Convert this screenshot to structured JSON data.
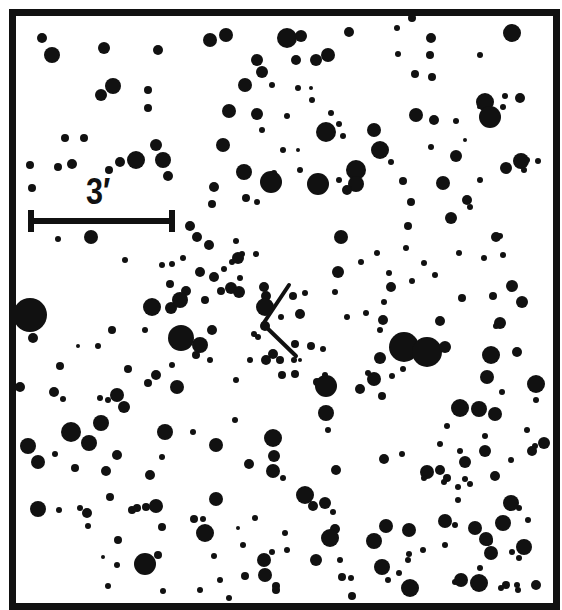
{
  "chart": {
    "title": "",
    "type": "finder-chart",
    "background": "#ffffff",
    "ink": "#111111",
    "scale_bar": {
      "label": "3′",
      "x1": 31,
      "x2": 172,
      "y": 221,
      "tick_height": 22,
      "thickness": 6
    },
    "target_marker": {
      "vertex": [
        263,
        324
      ],
      "upper_end": [
        289,
        285
      ],
      "lower_end": [
        296,
        356
      ],
      "width": 4
    },
    "frame": {
      "x": 9,
      "y": 9,
      "width": 544,
      "height": 594,
      "border": 7
    }
  },
  "stars": [
    [
      42,
      38,
      5
    ],
    [
      52,
      55,
      8
    ],
    [
      104,
      48,
      6
    ],
    [
      158,
      50,
      5
    ],
    [
      113,
      86,
      8
    ],
    [
      101,
      95,
      6
    ],
    [
      148,
      90,
      4
    ],
    [
      148,
      108,
      4
    ],
    [
      65,
      138,
      4
    ],
    [
      84,
      138,
      4
    ],
    [
      156,
      145,
      6
    ],
    [
      163,
      160,
      8
    ],
    [
      136,
      160,
      9
    ],
    [
      120,
      162,
      5
    ],
    [
      109,
      170,
      4
    ],
    [
      72,
      164,
      5
    ],
    [
      58,
      167,
      4
    ],
    [
      30,
      165,
      4
    ],
    [
      32,
      188,
      4
    ],
    [
      168,
      176,
      5
    ],
    [
      91,
      237,
      7
    ],
    [
      58,
      239,
      3
    ],
    [
      125,
      260,
      3
    ],
    [
      172,
      264,
      3
    ],
    [
      210,
      40,
      7
    ],
    [
      226,
      35,
      7
    ],
    [
      287,
      38,
      10
    ],
    [
      301,
      36,
      6
    ],
    [
      349,
      32,
      5
    ],
    [
      257,
      60,
      6
    ],
    [
      262,
      72,
      6
    ],
    [
      296,
      60,
      5
    ],
    [
      316,
      60,
      6
    ],
    [
      328,
      55,
      7
    ],
    [
      245,
      85,
      7
    ],
    [
      272,
      85,
      3
    ],
    [
      298,
      88,
      3
    ],
    [
      311,
      88,
      2
    ],
    [
      312,
      100,
      3
    ],
    [
      229,
      111,
      7
    ],
    [
      257,
      114,
      6
    ],
    [
      223,
      145,
      7
    ],
    [
      262,
      130,
      3
    ],
    [
      287,
      116,
      3
    ],
    [
      331,
      113,
      3
    ],
    [
      326,
      132,
      10
    ],
    [
      339,
      124,
      3
    ],
    [
      343,
      136,
      3
    ],
    [
      298,
      150,
      2
    ],
    [
      283,
      150,
      3
    ],
    [
      274,
      173,
      3
    ],
    [
      244,
      172,
      8
    ],
    [
      271,
      182,
      11
    ],
    [
      318,
      184,
      11
    ],
    [
      356,
      170,
      10
    ],
    [
      356,
      184,
      8
    ],
    [
      347,
      190,
      5
    ],
    [
      339,
      180,
      3
    ],
    [
      214,
      187,
      5
    ],
    [
      212,
      204,
      4
    ],
    [
      246,
      198,
      4
    ],
    [
      257,
      202,
      3
    ],
    [
      256,
      254,
      3
    ],
    [
      300,
      170,
      3
    ],
    [
      412,
      18,
      4
    ],
    [
      397,
      28,
      3
    ],
    [
      431,
      38,
      5
    ],
    [
      430,
      55,
      4
    ],
    [
      480,
      55,
      3
    ],
    [
      512,
      33,
      9
    ],
    [
      398,
      54,
      3
    ],
    [
      415,
      74,
      4
    ],
    [
      432,
      77,
      4
    ],
    [
      416,
      115,
      7
    ],
    [
      434,
      120,
      5
    ],
    [
      484,
      105,
      3
    ],
    [
      479,
      107,
      2
    ],
    [
      505,
      96,
      3
    ],
    [
      485,
      102,
      9
    ],
    [
      490,
      117,
      11
    ],
    [
      503,
      107,
      3
    ],
    [
      520,
      98,
      5
    ],
    [
      456,
      121,
      3
    ],
    [
      456,
      156,
      6
    ],
    [
      374,
      130,
      7
    ],
    [
      380,
      150,
      9
    ],
    [
      431,
      147,
      3
    ],
    [
      391,
      162,
      3
    ],
    [
      465,
      140,
      2
    ],
    [
      443,
      183,
      7
    ],
    [
      480,
      180,
      3
    ],
    [
      506,
      168,
      6
    ],
    [
      521,
      161,
      8
    ],
    [
      524,
      170,
      3
    ],
    [
      527,
      160,
      3
    ],
    [
      538,
      161,
      3
    ],
    [
      403,
      181,
      4
    ],
    [
      411,
      202,
      4
    ],
    [
      408,
      226,
      4
    ],
    [
      467,
      200,
      5
    ],
    [
      470,
      207,
      3
    ],
    [
      451,
      218,
      6
    ],
    [
      500,
      236,
      3
    ],
    [
      424,
      263,
      3
    ],
    [
      406,
      248,
      3
    ],
    [
      435,
      275,
      3
    ],
    [
      389,
      273,
      3
    ],
    [
      412,
      281,
      3
    ],
    [
      459,
      253,
      3
    ],
    [
      503,
      255,
      3
    ],
    [
      484,
      258,
      3
    ],
    [
      391,
      287,
      5
    ],
    [
      384,
      302,
      3
    ],
    [
      396,
      350,
      5
    ],
    [
      496,
      237,
      5
    ],
    [
      522,
      302,
      6
    ],
    [
      512,
      286,
      6
    ],
    [
      242,
      254,
      3
    ],
    [
      232,
      262,
      3
    ],
    [
      190,
      226,
      5
    ],
    [
      197,
      237,
      5
    ],
    [
      238,
      258,
      6
    ],
    [
      209,
      245,
      5
    ],
    [
      170,
      284,
      4
    ],
    [
      200,
      272,
      5
    ],
    [
      224,
      269,
      3
    ],
    [
      183,
      258,
      3
    ],
    [
      240,
      278,
      3
    ],
    [
      231,
      288,
      6
    ],
    [
      239,
      292,
      6
    ],
    [
      221,
      291,
      4
    ],
    [
      171,
      308,
      6
    ],
    [
      186,
      291,
      5
    ],
    [
      205,
      300,
      4
    ],
    [
      214,
      277,
      5
    ],
    [
      236,
      241,
      3
    ],
    [
      162,
      265,
      3
    ],
    [
      180,
      300,
      8
    ],
    [
      264,
      287,
      5
    ],
    [
      266,
      296,
      5
    ],
    [
      265,
      307,
      9
    ],
    [
      265,
      326,
      5
    ],
    [
      258,
      337,
      3
    ],
    [
      281,
      317,
      3
    ],
    [
      300,
      314,
      5
    ],
    [
      293,
      296,
      4
    ],
    [
      305,
      293,
      3
    ],
    [
      341,
      237,
      7
    ],
    [
      338,
      272,
      6
    ],
    [
      361,
      262,
      3
    ],
    [
      377,
      253,
      3
    ],
    [
      335,
      292,
      3
    ],
    [
      347,
      317,
      3
    ],
    [
      295,
      344,
      4
    ],
    [
      366,
      313,
      3
    ],
    [
      294,
      360,
      3
    ],
    [
      311,
      346,
      4
    ],
    [
      295,
      374,
      4
    ],
    [
      317,
      382,
      4
    ],
    [
      325,
      375,
      3
    ],
    [
      30,
      315,
      17
    ],
    [
      33,
      338,
      5
    ],
    [
      78,
      346,
      2
    ],
    [
      98,
      346,
      3
    ],
    [
      152,
      307,
      9
    ],
    [
      200,
      345,
      8
    ],
    [
      212,
      330,
      5
    ],
    [
      112,
      330,
      4
    ],
    [
      145,
      330,
      3
    ],
    [
      181,
      338,
      13
    ],
    [
      254,
      334,
      3
    ],
    [
      273,
      354,
      5
    ],
    [
      323,
      349,
      3
    ],
    [
      210,
      360,
      3
    ],
    [
      280,
      360,
      4
    ],
    [
      300,
      360,
      2
    ],
    [
      60,
      366,
      4
    ],
    [
      63,
      399,
      3
    ],
    [
      128,
      369,
      4
    ],
    [
      156,
      375,
      5
    ],
    [
      174,
      388,
      3
    ],
    [
      172,
      365,
      3
    ],
    [
      196,
      355,
      4
    ],
    [
      266,
      360,
      5
    ],
    [
      250,
      360,
      3
    ],
    [
      20,
      387,
      5
    ],
    [
      54,
      392,
      5
    ],
    [
      117,
      395,
      7
    ],
    [
      124,
      407,
      6
    ],
    [
      100,
      398,
      3
    ],
    [
      148,
      383,
      4
    ],
    [
      236,
      380,
      3
    ],
    [
      282,
      375,
      4
    ],
    [
      326,
      386,
      11
    ],
    [
      360,
      389,
      5
    ],
    [
      326,
      413,
      8
    ],
    [
      374,
      379,
      7
    ],
    [
      368,
      373,
      3
    ],
    [
      392,
      376,
      3
    ],
    [
      404,
      347,
      15
    ],
    [
      427,
      352,
      15
    ],
    [
      445,
      347,
      6
    ],
    [
      440,
      321,
      5
    ],
    [
      462,
      298,
      4
    ],
    [
      493,
      296,
      4
    ],
    [
      500,
      323,
      6
    ],
    [
      380,
      358,
      6
    ],
    [
      382,
      396,
      4
    ],
    [
      403,
      369,
      3
    ],
    [
      383,
      320,
      5
    ],
    [
      380,
      330,
      3
    ],
    [
      28,
      446,
      8
    ],
    [
      71,
      432,
      10
    ],
    [
      89,
      443,
      8
    ],
    [
      101,
      423,
      8
    ],
    [
      165,
      432,
      8
    ],
    [
      108,
      400,
      3
    ],
    [
      38,
      462,
      7
    ],
    [
      55,
      454,
      3
    ],
    [
      106,
      471,
      5
    ],
    [
      87,
      513,
      5
    ],
    [
      75,
      468,
      4
    ],
    [
      117,
      455,
      5
    ],
    [
      150,
      475,
      5
    ],
    [
      162,
      457,
      3
    ],
    [
      177,
      387,
      7
    ],
    [
      216,
      445,
      7
    ],
    [
      193,
      432,
      3
    ],
    [
      235,
      420,
      3
    ],
    [
      273,
      438,
      9
    ],
    [
      274,
      456,
      6
    ],
    [
      273,
      471,
      7
    ],
    [
      283,
      478,
      3
    ],
    [
      249,
      464,
      5
    ],
    [
      328,
      430,
      3
    ],
    [
      336,
      470,
      5
    ],
    [
      460,
      408,
      9
    ],
    [
      479,
      409,
      8
    ],
    [
      487,
      377,
      7
    ],
    [
      502,
      392,
      3
    ],
    [
      491,
      355,
      9
    ],
    [
      517,
      352,
      5
    ],
    [
      496,
      326,
      3
    ],
    [
      536,
      384,
      9
    ],
    [
      495,
      414,
      7
    ],
    [
      485,
      436,
      3
    ],
    [
      544,
      443,
      6
    ],
    [
      535,
      446,
      3
    ],
    [
      440,
      444,
      3
    ],
    [
      460,
      451,
      3
    ],
    [
      465,
      462,
      6
    ],
    [
      440,
      470,
      5
    ],
    [
      447,
      478,
      4
    ],
    [
      444,
      482,
      3
    ],
    [
      458,
      487,
      3
    ],
    [
      470,
      484,
      3
    ],
    [
      427,
      472,
      7
    ],
    [
      447,
      426,
      3
    ],
    [
      458,
      500,
      3
    ],
    [
      485,
      451,
      6
    ],
    [
      495,
      476,
      5
    ],
    [
      511,
      460,
      3
    ],
    [
      519,
      508,
      3
    ],
    [
      38,
      509,
      8
    ],
    [
      59,
      510,
      3
    ],
    [
      80,
      508,
      3
    ],
    [
      110,
      497,
      4
    ],
    [
      88,
      526,
      3
    ],
    [
      132,
      510,
      4
    ],
    [
      137,
      508,
      4
    ],
    [
      146,
      507,
      4
    ],
    [
      156,
      506,
      7
    ],
    [
      162,
      527,
      4
    ],
    [
      158,
      555,
      4
    ],
    [
      117,
      565,
      3
    ],
    [
      103,
      557,
      2
    ],
    [
      118,
      540,
      4
    ],
    [
      145,
      564,
      11
    ],
    [
      108,
      586,
      3
    ],
    [
      163,
      591,
      3
    ],
    [
      200,
      590,
      3
    ],
    [
      243,
      545,
      3
    ],
    [
      238,
      528,
      2
    ],
    [
      214,
      556,
      3
    ],
    [
      205,
      533,
      9
    ],
    [
      216,
      499,
      7
    ],
    [
      194,
      519,
      4
    ],
    [
      255,
      518,
      3
    ],
    [
      203,
      519,
      3
    ],
    [
      220,
      580,
      3
    ],
    [
      229,
      598,
      3
    ],
    [
      245,
      576,
      4
    ],
    [
      264,
      560,
      7
    ],
    [
      272,
      552,
      3
    ],
    [
      265,
      575,
      7
    ],
    [
      276,
      586,
      4
    ],
    [
      305,
      495,
      9
    ],
    [
      313,
      506,
      5
    ],
    [
      325,
      503,
      6
    ],
    [
      287,
      550,
      3
    ],
    [
      285,
      533,
      3
    ],
    [
      335,
      529,
      5
    ],
    [
      333,
      512,
      3
    ],
    [
      330,
      538,
      9
    ],
    [
      316,
      560,
      6
    ],
    [
      340,
      560,
      3
    ],
    [
      342,
      577,
      4
    ],
    [
      351,
      578,
      3
    ],
    [
      276,
      590,
      4
    ],
    [
      352,
      596,
      4
    ],
    [
      374,
      541,
      8
    ],
    [
      386,
      526,
      7
    ],
    [
      382,
      567,
      8
    ],
    [
      388,
      580,
      3
    ],
    [
      409,
      530,
      7
    ],
    [
      424,
      478,
      3
    ],
    [
      409,
      554,
      3
    ],
    [
      384,
      459,
      5
    ],
    [
      402,
      454,
      3
    ],
    [
      408,
      560,
      3
    ],
    [
      410,
      588,
      9
    ],
    [
      423,
      550,
      3
    ],
    [
      445,
      521,
      7
    ],
    [
      455,
      525,
      3
    ],
    [
      465,
      479,
      3
    ],
    [
      445,
      545,
      3
    ],
    [
      475,
      528,
      7
    ],
    [
      486,
      539,
      7
    ],
    [
      480,
      568,
      3
    ],
    [
      488,
      541,
      5
    ],
    [
      491,
      553,
      7
    ],
    [
      503,
      523,
      8
    ],
    [
      511,
      503,
      8
    ],
    [
      519,
      558,
      3
    ],
    [
      512,
      552,
      3
    ],
    [
      524,
      547,
      8
    ],
    [
      528,
      520,
      3
    ],
    [
      455,
      582,
      3
    ],
    [
      461,
      580,
      7
    ],
    [
      479,
      583,
      9
    ],
    [
      506,
      585,
      4
    ],
    [
      518,
      590,
      3
    ],
    [
      536,
      585,
      5
    ],
    [
      517,
      585,
      3
    ],
    [
      501,
      588,
      3
    ],
    [
      399,
      573,
      3
    ],
    [
      536,
      400,
      3
    ],
    [
      527,
      430,
      3
    ],
    [
      532,
      451,
      5
    ]
  ]
}
